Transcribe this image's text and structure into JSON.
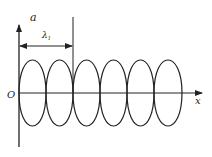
{
  "diagram": {
    "labels": {
      "y_axis": "a",
      "x_axis": "x",
      "origin": "O",
      "wavelength": "λ",
      "wavelength_sub": "1"
    },
    "loops": 6,
    "stroke_color": "#222222"
  }
}
